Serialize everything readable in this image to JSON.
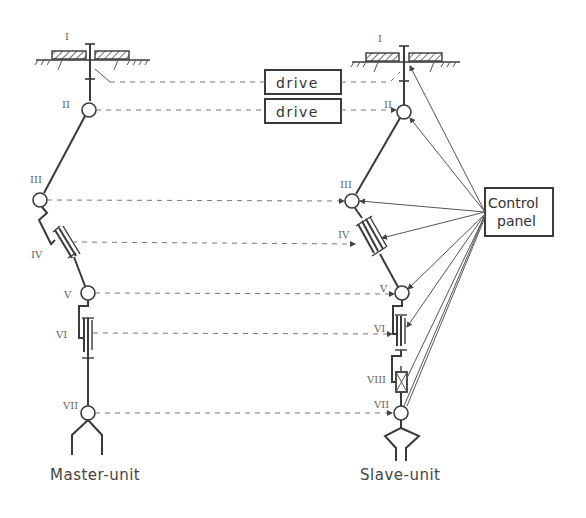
{
  "diagram": {
    "type": "master-slave manipulator schematic",
    "drive_boxes": [
      {
        "label": "drive"
      },
      {
        "label": "drive"
      }
    ],
    "control_panel": {
      "line1": "Control",
      "line2": "panel"
    },
    "master": {
      "caption": "Master-unit",
      "joints": [
        "I",
        "II",
        "III",
        "IV",
        "V",
        "VI",
        "VII"
      ]
    },
    "slave": {
      "caption": "Slave-unit",
      "joints": [
        "I",
        "II",
        "III",
        "IV",
        "V",
        "VI",
        "VIII",
        "VII"
      ]
    },
    "colors": {
      "ink": "#3a3a3a",
      "dashed": "#777777",
      "background": "#ffffff"
    }
  }
}
